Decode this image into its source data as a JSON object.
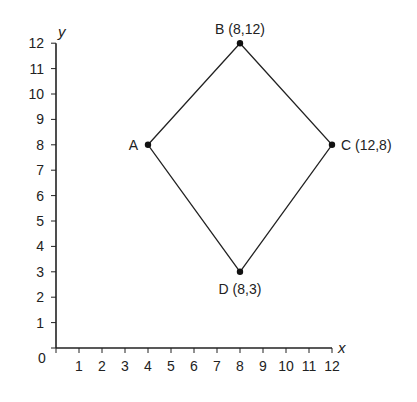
{
  "chart_data": {
    "type": "scatter",
    "title": "",
    "xlabel": "x",
    "ylabel": "y",
    "xlim": [
      0,
      12
    ],
    "ylim": [
      0,
      12
    ],
    "grid": false,
    "origin_label": "0",
    "x_ticks": [
      1,
      2,
      3,
      4,
      5,
      6,
      7,
      8,
      9,
      10,
      11,
      12
    ],
    "y_ticks": [
      1,
      2,
      3,
      4,
      5,
      6,
      7,
      8,
      9,
      10,
      11,
      12
    ],
    "points": [
      {
        "name": "A",
        "x": 4,
        "y": 8,
        "label": "A",
        "label_pos": "left"
      },
      {
        "name": "B",
        "x": 8,
        "y": 12,
        "label": "B (8,12)",
        "label_pos": "top"
      },
      {
        "name": "C",
        "x": 12,
        "y": 8,
        "label": "C (12,8)",
        "label_pos": "right"
      },
      {
        "name": "D",
        "x": 8,
        "y": 3,
        "label": "D (8,3)",
        "label_pos": "bottom"
      }
    ],
    "polygon": [
      "A",
      "B",
      "C",
      "D"
    ],
    "shape": "quadrilateral (kite) ABCD",
    "line_color": "#222222",
    "point_color": "#111111"
  }
}
